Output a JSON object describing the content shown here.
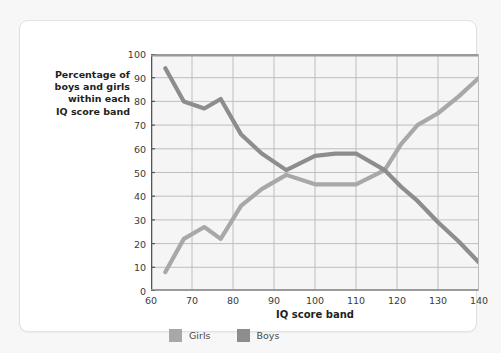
{
  "chart_data": {
    "type": "line",
    "title": "",
    "xlabel": "IQ score band",
    "ylabel": "Percentage of boys and girls within each IQ score band",
    "xlim": [
      60,
      140
    ],
    "ylim": [
      0,
      100
    ],
    "xticks": [
      60,
      70,
      80,
      90,
      100,
      110,
      120,
      130,
      140
    ],
    "yticks": [
      0,
      10,
      20,
      30,
      40,
      50,
      60,
      70,
      80,
      90,
      100
    ],
    "grid": true,
    "legend_position": "bottom",
    "series": [
      {
        "name": "Girls",
        "color": "#a8a8a8",
        "x": [
          63.5,
          68,
          73,
          77,
          82,
          87,
          93,
          100,
          105,
          110,
          117,
          121,
          125,
          130,
          135,
          140
        ],
        "values": [
          8,
          22,
          27,
          22,
          36,
          43,
          49,
          45,
          45,
          45,
          51,
          62,
          70,
          75,
          82,
          90
        ]
      },
      {
        "name": "Boys",
        "color": "#8d8d8d",
        "x": [
          63.5,
          68,
          73,
          77,
          82,
          87,
          93,
          100,
          105,
          110,
          117,
          121,
          125,
          130,
          135,
          140
        ],
        "values": [
          94,
          80,
          77,
          81,
          66,
          58,
          51,
          57,
          58,
          58,
          51,
          44,
          38,
          29,
          21,
          12
        ]
      }
    ]
  },
  "axis": {
    "y_label_lines": [
      "Percentage of",
      "boys and girls",
      "within each",
      "IQ score band"
    ],
    "x_label": "IQ score band"
  },
  "legend": {
    "items": [
      {
        "label": "Girls",
        "color": "#a8a8a8"
      },
      {
        "label": "Boys",
        "color": "#8d8d8d"
      }
    ]
  },
  "colors": {
    "plot_background": "#f5f5f5",
    "grid": "#b9b9b9",
    "axis": "#555555",
    "card_background": "#ffffff",
    "page_background": "#f7f7f7"
  }
}
